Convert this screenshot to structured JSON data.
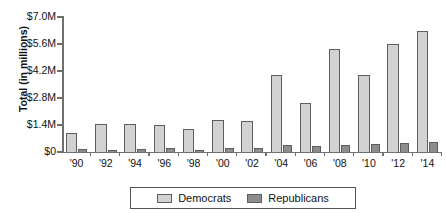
{
  "chart_data": {
    "type": "bar",
    "title": "",
    "xlabel": "",
    "ylabel": "Total (in millions)",
    "categories": [
      "'90",
      "'92",
      "'94",
      "'96",
      "'98",
      "'00",
      "'02",
      "'04",
      "'06",
      "'08",
      "'10",
      "'12",
      "'14"
    ],
    "series": [
      {
        "name": "Democrats",
        "color": "#d2d2d2",
        "values": [
          0.98,
          1.45,
          1.43,
          1.41,
          1.2,
          1.65,
          1.62,
          4.0,
          2.55,
          5.35,
          3.97,
          5.62,
          6.3
        ]
      },
      {
        "name": "Republicans",
        "color": "#8d8d8d",
        "values": [
          0.16,
          0.08,
          0.15,
          0.2,
          0.12,
          0.2,
          0.2,
          0.37,
          0.32,
          0.35,
          0.41,
          0.47,
          0.52
        ]
      }
    ],
    "ylim": [
      0,
      7.0
    ],
    "ytick_values": [
      7.0,
      5.6,
      4.2,
      2.8,
      1.4,
      0
    ],
    "ytick_labels": [
      "$7.0M",
      "$5.6M",
      "$4.2M",
      "$2.8M",
      "$1.4M",
      "$0"
    ],
    "grid": false,
    "legend_position": "bottom"
  },
  "legend": {
    "democrats_label": "Democrats",
    "republicans_label": "Republicans"
  },
  "title_fragment": ""
}
